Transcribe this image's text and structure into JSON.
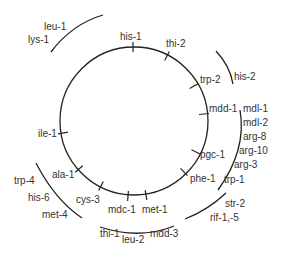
{
  "diagram": {
    "colors": {
      "line": "#222222",
      "text": "#333333",
      "background": "#ffffff"
    },
    "circle": {
      "cx": 134,
      "cy": 121,
      "r": 74
    },
    "markers": [
      {
        "label": "his-1",
        "tick": [
          133,
          47,
          0
        ],
        "pos": [
          120,
          40
        ]
      },
      {
        "label": "thi-2",
        "tick": [
          167,
          56,
          30
        ],
        "pos": [
          166,
          47
        ]
      },
      {
        "label": "trp-2",
        "tick": [
          194,
          86,
          60
        ],
        "pos": [
          200,
          83
        ]
      },
      {
        "label": "mdd-1",
        "tick": [
          204,
          114,
          85
        ],
        "pos": [
          209,
          112
        ]
      },
      {
        "label": "pgc-1",
        "tick": [
          196,
          152,
          120
        ],
        "pos": [
          200,
          158
        ]
      },
      {
        "label": "phe-1",
        "tick": [
          184,
          172,
          135
        ],
        "pos": [
          190,
          182
        ]
      },
      {
        "label": "met-1",
        "tick": [
          146,
          195,
          170
        ],
        "pos": [
          142,
          213
        ]
      },
      {
        "label": "mdc-1",
        "tick": [
          128,
          196,
          180
        ],
        "pos": [
          108,
          213
        ]
      },
      {
        "label": "cys-3",
        "tick": [
          101,
          186,
          205
        ],
        "pos": [
          76,
          203
        ]
      },
      {
        "label": "ala-1",
        "tick": [
          79,
          169,
          228
        ],
        "pos": [
          52,
          178
        ]
      },
      {
        "label": "ile-1",
        "tick": [
          63,
          133,
          260
        ],
        "pos": [
          38,
          137
        ]
      }
    ],
    "outer_labels": [
      {
        "label": "leu-1",
        "pos": [
          44,
          30
        ]
      },
      {
        "label": "lys-1",
        "pos": [
          28,
          43
        ]
      },
      {
        "label": "his-2",
        "pos": [
          234,
          80
        ]
      },
      {
        "label": "mdl-1",
        "pos": [
          243,
          112
        ]
      },
      {
        "label": "mdl-2",
        "pos": [
          243,
          126
        ]
      },
      {
        "label": "arg-8",
        "pos": [
          243,
          140
        ]
      },
      {
        "label": "arg-10",
        "pos": [
          239,
          154
        ]
      },
      {
        "label": "arg-3",
        "pos": [
          234,
          168
        ]
      },
      {
        "label": "trp-1",
        "pos": [
          224,
          183
        ]
      },
      {
        "label": "str-2",
        "pos": [
          225,
          207
        ]
      },
      {
        "label": "rif-1,-5",
        "pos": [
          210,
          221
        ]
      },
      {
        "label": "mdd-3",
        "pos": [
          150,
          237
        ]
      },
      {
        "label": "leu-2",
        "pos": [
          122,
          243
        ]
      },
      {
        "label": "thi-1",
        "pos": [
          100,
          237
        ]
      },
      {
        "label": "trp-4",
        "pos": [
          14,
          184
        ]
      },
      {
        "label": "his-6",
        "pos": [
          28,
          201
        ]
      },
      {
        "label": "met-4",
        "pos": [
          42,
          218
        ]
      }
    ],
    "arcs": [
      {
        "name": "arc-leu1-lys1",
        "d": "M 51 52 Q 72 24 103 15"
      },
      {
        "name": "arc-his2",
        "d": "M 216 51 Q 230 66 233 84"
      },
      {
        "name": "arc-mdl-trp1",
        "d": "M 240 110 Q 247 150 218 190"
      },
      {
        "name": "arc-str2-rif",
        "d": "M 226 193 Q 208 210 185 219"
      },
      {
        "name": "arc-thi1-mdd3",
        "d": "M 100 227 Q 140 240 174 226"
      },
      {
        "name": "arc-trp4-met4",
        "d": "M 36 163 Q 55 200 82 218"
      }
    ]
  }
}
